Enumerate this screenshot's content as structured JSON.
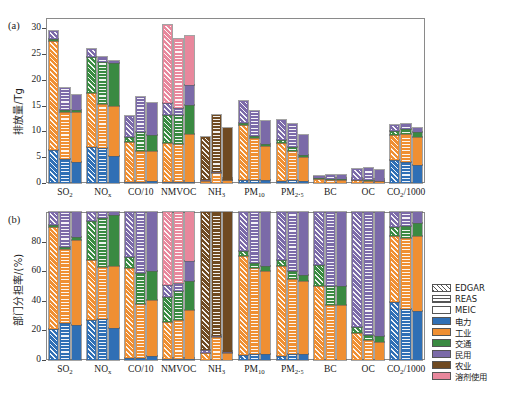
{
  "figure": {
    "panel_a_tag": "(a)",
    "panel_b_tag": "(b)"
  },
  "legend": {
    "position": "right-middle",
    "inventories": [
      {
        "label": "EDGAR",
        "pattern": "diagonal-hatch"
      },
      {
        "label": "REAS",
        "pattern": "horizontal-hatch"
      },
      {
        "label": "MEIC",
        "pattern": "solid-white"
      }
    ],
    "sectors": [
      {
        "label": "电力",
        "color": "#2f6fb5"
      },
      {
        "label": "工业",
        "color": "#ef8f32"
      },
      {
        "label": "交通",
        "color": "#3a8a42"
      },
      {
        "label": "民用",
        "color": "#7b6aa8"
      },
      {
        "label": "农业",
        "color": "#6f4a22"
      },
      {
        "label": "溶剂使用",
        "color": "#e8879c"
      }
    ]
  },
  "chart_data": [
    {
      "type": "bar",
      "id": "panel-a",
      "title": "",
      "xlabel": "",
      "ylabel": "排放量/Tg",
      "ylim": [
        0,
        32
      ],
      "yticks": [
        0,
        5,
        10,
        15,
        20,
        25,
        30
      ],
      "grid": false,
      "stacked": true,
      "categories": [
        "SO₂",
        "NOₓ",
        "CO/10",
        "NMVOC",
        "NH₃",
        "PM₁₀",
        "PM₂.₅",
        "BC",
        "OC",
        "CO₂/1000"
      ],
      "sector_order": [
        "电力",
        "工业",
        "交通",
        "民用",
        "农业",
        "溶剂使用"
      ],
      "groups": [
        {
          "category": "SO₂",
          "bars": [
            {
              "inventory": "EDGAR",
              "total": 30.6,
              "values": [
                6.4,
                21.2,
                0.3,
                1.5,
                0.0,
                0.0
              ]
            },
            {
              "inventory": "REAS",
              "total": 18.4,
              "values": [
                4.6,
                9.2,
                0.3,
                4.3,
                0.0,
                0.0
              ]
            },
            {
              "inventory": "MEIC",
              "total": 17.0,
              "values": [
                4.0,
                9.8,
                0.3,
                2.9,
                0.0,
                0.0
              ]
            }
          ]
        },
        {
          "category": "NOₓ",
          "bars": [
            {
              "inventory": "EDGAR",
              "total": 26.0,
              "values": [
                7.0,
                10.5,
                7.0,
                1.5,
                0.0,
                0.0
              ]
            },
            {
              "inventory": "REAS",
              "total": 24.4,
              "values": [
                6.8,
                8.6,
                8.0,
                1.0,
                0.0,
                0.0
              ]
            },
            {
              "inventory": "MEIC",
              "total": 23.7,
              "values": [
                5.2,
                9.8,
                8.2,
                0.5,
                0.0,
                0.0
              ]
            }
          ]
        },
        {
          "category": "CO/10",
          "bars": [
            {
              "inventory": "EDGAR",
              "total": 12.9,
              "values": [
                0.2,
                7.8,
                1.0,
                3.9,
                0.0,
                0.0
              ]
            },
            {
              "inventory": "REAS",
              "total": 16.7,
              "values": [
                0.2,
                6.1,
                3.5,
                6.9,
                0.0,
                0.0
              ]
            },
            {
              "inventory": "MEIC",
              "total": 15.5,
              "values": [
                0.4,
                5.9,
                3.0,
                6.2,
                0.0,
                0.0
              ]
            }
          ]
        },
        {
          "category": "NMVOC",
          "bars": [
            {
              "inventory": "EDGAR",
              "total": 30.7,
              "values": [
                0.2,
                7.6,
                5.3,
                2.4,
                0.0,
                15.2
              ]
            },
            {
              "inventory": "REAS",
              "total": 28.0,
              "values": [
                0.2,
                7.4,
                5.5,
                1.4,
                0.0,
                13.5
              ]
            },
            {
              "inventory": "MEIC",
              "total": 28.5,
              "values": [
                0.2,
                9.4,
                5.6,
                3.8,
                0.0,
                9.5
              ]
            }
          ]
        },
        {
          "category": "NH₃",
          "bars": [
            {
              "inventory": "EDGAR",
              "total": 8.9,
              "values": [
                0.0,
                0.4,
                0.0,
                0.2,
                8.3,
                0.0
              ]
            },
            {
              "inventory": "REAS",
              "total": 13.1,
              "values": [
                0.0,
                2.0,
                0.0,
                0.1,
                11.0,
                0.0
              ]
            },
            {
              "inventory": "MEIC",
              "total": 10.6,
              "values": [
                0.0,
                0.5,
                0.0,
                0.1,
                10.0,
                0.0
              ]
            }
          ]
        },
        {
          "category": "PM₁₀",
          "bars": [
            {
              "inventory": "EDGAR",
              "total": 15.9,
              "values": [
                0.5,
                10.7,
                0.5,
                4.2,
                0.0,
                0.0
              ]
            },
            {
              "inventory": "REAS",
              "total": 14.0,
              "values": [
                0.6,
                8.1,
                0.5,
                4.8,
                0.0,
                0.0
              ]
            },
            {
              "inventory": "MEIC",
              "total": 12.0,
              "values": [
                0.5,
                6.7,
                0.4,
                4.4,
                0.0,
                0.0
              ]
            }
          ]
        },
        {
          "category": "PM₂.₅",
          "bars": [
            {
              "inventory": "EDGAR",
              "total": 12.3,
              "values": [
                0.3,
                7.5,
                0.5,
                4.0,
                0.0,
                0.0
              ]
            },
            {
              "inventory": "REAS",
              "total": 11.5,
              "values": [
                0.5,
                5.8,
                0.6,
                4.6,
                0.0,
                0.0
              ]
            },
            {
              "inventory": "MEIC",
              "total": 9.4,
              "values": [
                0.4,
                4.6,
                0.4,
                4.0,
                0.0,
                0.0
              ]
            }
          ]
        },
        {
          "category": "BC",
          "bars": [
            {
              "inventory": "EDGAR",
              "total": 1.4,
              "values": [
                0.0,
                0.7,
                0.2,
                0.5,
                0.0,
                0.0
              ]
            },
            {
              "inventory": "REAS",
              "total": 1.6,
              "values": [
                0.0,
                0.6,
                0.2,
                0.8,
                0.0,
                0.0
              ]
            },
            {
              "inventory": "MEIC",
              "total": 1.6,
              "values": [
                0.0,
                0.6,
                0.2,
                0.8,
                0.0,
                0.0
              ]
            }
          ]
        },
        {
          "category": "OC",
          "bars": [
            {
              "inventory": "EDGAR",
              "total": 2.7,
              "values": [
                0.0,
                0.5,
                0.1,
                2.1,
                0.0,
                0.0
              ]
            },
            {
              "inventory": "REAS",
              "total": 3.0,
              "values": [
                0.0,
                0.4,
                0.1,
                2.5,
                0.0,
                0.0
              ]
            },
            {
              "inventory": "MEIC",
              "total": 2.5,
              "values": [
                0.0,
                0.3,
                0.1,
                2.1,
                0.0,
                0.0
              ]
            }
          ]
        },
        {
          "category": "CO₂/1000",
          "bars": [
            {
              "inventory": "EDGAR",
              "total": 11.2,
              "values": [
                4.4,
                5.0,
                0.7,
                1.1,
                0.0,
                0.0
              ]
            },
            {
              "inventory": "REAS",
              "total": 11.5,
              "values": [
                4.0,
                5.5,
                0.9,
                1.1,
                0.0,
                0.0
              ]
            },
            {
              "inventory": "MEIC",
              "total": 10.6,
              "values": [
                3.5,
                5.4,
                0.9,
                0.8,
                0.0,
                0.0
              ]
            }
          ]
        }
      ]
    },
    {
      "type": "bar",
      "id": "panel-b",
      "title": "",
      "xlabel": "",
      "ylabel": "部门分担率/(%)",
      "ylim": [
        0,
        100
      ],
      "yticks": [
        0,
        20,
        40,
        60,
        80
      ],
      "grid": false,
      "stacked": true,
      "normalized": true,
      "categories": [
        "SO₂",
        "NOₓ",
        "CO/10",
        "NMVOC",
        "NH₃",
        "PM₁₀",
        "PM₂.₅",
        "BC",
        "OC",
        "CO₂/1000"
      ],
      "sector_order": [
        "电力",
        "工业",
        "交通",
        "民用",
        "农业",
        "溶剂使用"
      ],
      "groups": [
        {
          "category": "SO₂",
          "bars": [
            {
              "inventory": "EDGAR",
              "values": [
                20.9,
                69.3,
                1.0,
                8.8,
                0.0,
                0.0
              ]
            },
            {
              "inventory": "REAS",
              "values": [
                25.0,
                50.0,
                1.6,
                23.4,
                0.0,
                0.0
              ]
            },
            {
              "inventory": "MEIC",
              "values": [
                23.5,
                57.6,
                1.8,
                17.1,
                0.0,
                0.0
              ]
            }
          ]
        },
        {
          "category": "NOₓ",
          "bars": [
            {
              "inventory": "EDGAR",
              "values": [
                26.9,
                40.4,
                26.9,
                5.8,
                0.0,
                0.0
              ]
            },
            {
              "inventory": "REAS",
              "values": [
                27.9,
                35.2,
                32.8,
                4.1,
                0.0,
                0.0
              ]
            },
            {
              "inventory": "MEIC",
              "values": [
                21.9,
                41.4,
                34.6,
                2.1,
                0.0,
                0.0
              ]
            }
          ]
        },
        {
          "category": "CO/10",
          "bars": [
            {
              "inventory": "EDGAR",
              "values": [
                1.6,
                60.5,
                7.8,
                30.1,
                0.0,
                0.0
              ]
            },
            {
              "inventory": "REAS",
              "values": [
                1.2,
                36.5,
                21.0,
                41.3,
                0.0,
                0.0
              ]
            },
            {
              "inventory": "MEIC",
              "values": [
                2.6,
                38.1,
                19.3,
                40.0,
                0.0,
                0.0
              ]
            }
          ]
        },
        {
          "category": "NMVOC",
          "bars": [
            {
              "inventory": "EDGAR",
              "values": [
                0.7,
                24.8,
                17.3,
                7.8,
                0.0,
                49.4
              ]
            },
            {
              "inventory": "REAS",
              "values": [
                0.7,
                26.4,
                19.6,
                5.0,
                0.0,
                48.3
              ]
            },
            {
              "inventory": "MEIC",
              "values": [
                0.7,
                33.0,
                19.6,
                13.3,
                0.0,
                33.4
              ]
            }
          ]
        },
        {
          "category": "NH₃",
          "bars": [
            {
              "inventory": "EDGAR",
              "values": [
                0.0,
                4.5,
                0.0,
                2.2,
                93.3,
                0.0
              ]
            },
            {
              "inventory": "REAS",
              "values": [
                0.0,
                15.3,
                0.0,
                0.8,
                83.9,
                0.0
              ]
            },
            {
              "inventory": "MEIC",
              "values": [
                0.0,
                4.7,
                0.0,
                0.9,
                94.4,
                0.0
              ]
            }
          ]
        },
        {
          "category": "PM₁₀",
          "bars": [
            {
              "inventory": "EDGAR",
              "values": [
                3.1,
                67.3,
                3.1,
                26.5,
                0.0,
                0.0
              ]
            },
            {
              "inventory": "REAS",
              "values": [
                4.3,
                57.9,
                3.6,
                34.2,
                0.0,
                0.0
              ]
            },
            {
              "inventory": "MEIC",
              "values": [
                4.2,
                55.8,
                3.3,
                36.7,
                0.0,
                0.0
              ]
            }
          ]
        },
        {
          "category": "PM₂.₅",
          "bars": [
            {
              "inventory": "EDGAR",
              "values": [
                2.4,
                61.0,
                4.1,
                32.5,
                0.0,
                0.0
              ]
            },
            {
              "inventory": "REAS",
              "values": [
                4.3,
                50.4,
                5.2,
                40.1,
                0.0,
                0.0
              ]
            },
            {
              "inventory": "MEIC",
              "values": [
                4.3,
                48.9,
                4.3,
                42.5,
                0.0,
                0.0
              ]
            }
          ]
        },
        {
          "category": "BC",
          "bars": [
            {
              "inventory": "EDGAR",
              "values": [
                0.0,
                50.0,
                14.3,
                35.7,
                0.0,
                0.0
              ]
            },
            {
              "inventory": "REAS",
              "values": [
                0.0,
                37.5,
                12.5,
                50.0,
                0.0,
                0.0
              ]
            },
            {
              "inventory": "MEIC",
              "values": [
                0.0,
                37.5,
                12.5,
                50.0,
                0.0,
                0.0
              ]
            }
          ]
        },
        {
          "category": "OC",
          "bars": [
            {
              "inventory": "EDGAR",
              "values": [
                0.0,
                18.5,
                3.7,
                77.8,
                0.0,
                0.0
              ]
            },
            {
              "inventory": "REAS",
              "values": [
                0.0,
                13.3,
                3.3,
                83.4,
                0.0,
                0.0
              ]
            },
            {
              "inventory": "MEIC",
              "values": [
                0.0,
                12.0,
                4.0,
                84.0,
                0.0,
                0.0
              ]
            }
          ]
        },
        {
          "category": "CO₂/1000",
          "bars": [
            {
              "inventory": "EDGAR",
              "values": [
                39.3,
                44.6,
                6.3,
                9.8,
                0.0,
                0.0
              ]
            },
            {
              "inventory": "REAS",
              "values": [
                34.8,
                47.8,
                7.8,
                9.6,
                0.0,
                0.0
              ]
            },
            {
              "inventory": "MEIC",
              "values": [
                33.0,
                50.9,
                8.5,
                7.6,
                0.0,
                0.0
              ]
            }
          ]
        }
      ]
    }
  ]
}
